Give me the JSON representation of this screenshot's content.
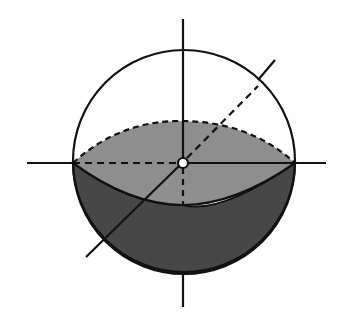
{
  "diagram": {
    "title": "",
    "colors": {
      "background": "#ffffff",
      "stroke": "#111111",
      "upper_cap_fill": "#8e8e8e",
      "lower_hemisphere_fill": "#474747",
      "center_marker_fill": "#ffffff"
    },
    "elements": [
      "sphere-outline",
      "equatorial-plane-ellipse",
      "vertical-axis",
      "horizontal-axis",
      "oblique-axis",
      "center-point"
    ]
  }
}
